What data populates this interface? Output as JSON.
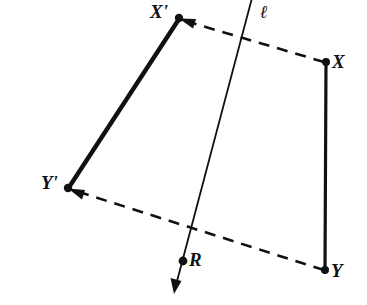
{
  "figure": {
    "type": "geometry-diagram",
    "background_color": "#ffffff",
    "ink_color": "#111111",
    "canvas": {
      "width": 367,
      "height": 305
    }
  },
  "labels": {
    "x_prime": "X'",
    "x": "X",
    "y_prime": "Y'",
    "y": "Y",
    "r": "R",
    "line_l": "ℓ"
  },
  "points": [
    {
      "id": "x_prime",
      "label": "X'",
      "x": 179,
      "y": 18,
      "label_x": 150,
      "label_y": 4,
      "dot": true
    },
    {
      "id": "x",
      "label": "X",
      "x": 326,
      "y": 62,
      "label_x": 331,
      "label_y": 52,
      "dot": true
    },
    {
      "id": "y_prime",
      "label": "Y'",
      "x": 68,
      "y": 188,
      "label_x": 41,
      "label_y": 174,
      "dot": true
    },
    {
      "id": "y",
      "label": "Y",
      "x": 325,
      "y": 270,
      "label_x": 330,
      "label_y": 262,
      "dot": true
    },
    {
      "id": "r",
      "label": "R",
      "x": 183,
      "y": 261,
      "label_x": 189,
      "label_y": 250,
      "dot": true
    }
  ],
  "segments": [
    {
      "id": "x-prime-y-prime",
      "name": "solid-segment-x-prime-y-prime",
      "style": "solid",
      "width": 4,
      "from": "x_prime",
      "to": "y_prime"
    },
    {
      "id": "x-y",
      "name": "solid-segment-x-y",
      "style": "solid",
      "width": 3,
      "from": "x",
      "to": "y"
    },
    {
      "id": "x-to-x-prime",
      "name": "dashed-arrow-x-to-x-prime",
      "style": "dashed",
      "width": 2.6,
      "from": "x",
      "to": "x_prime",
      "arrow_at": "to"
    },
    {
      "id": "y-to-y-prime",
      "name": "dashed-arrow-y-to-y-prime",
      "style": "dashed",
      "width": 2.6,
      "from": "y",
      "to": "y_prime",
      "arrow_at": "to"
    }
  ],
  "line_l": {
    "id": "line-l",
    "label": "ℓ",
    "label_x": 259,
    "label_y": 2,
    "style": "solid",
    "width": 1.7,
    "start": {
      "x": 252,
      "y": -2
    },
    "end": {
      "x": 174,
      "y": 293
    },
    "arrow_at": "end"
  }
}
